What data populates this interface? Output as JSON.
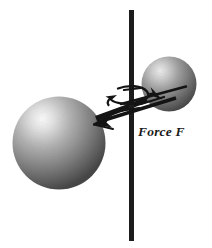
{
  "figure": {
    "background_color": "#ffffff",
    "width": 212,
    "height": 248,
    "labels": {
      "force": "Force F"
    },
    "axis": {
      "name": "rotation-axis",
      "orientation": "vertical",
      "color": "#1c1c1c",
      "x": 131.5,
      "y_top": 10,
      "y_bottom": 241,
      "thickness": 5
    },
    "spheres": [
      {
        "name": "large-sphere",
        "cx": 59,
        "cy": 143,
        "r": 46.5,
        "highlight_color": "#f2f2f2",
        "mid_color": "#8d8d8d",
        "edge_color": "#3f3f3f",
        "highlight_x_pct": 32,
        "highlight_y_pct": 24
      },
      {
        "name": "small-sphere",
        "cx": 169,
        "cy": 84,
        "r": 27.5,
        "highlight_color": "#e9e9e9",
        "mid_color": "#7e7e7e",
        "edge_color": "#3a3a3a",
        "highlight_x_pct": 34,
        "highlight_y_pct": 26
      }
    ],
    "rod": {
      "name": "connecting-rod",
      "color": "#141414",
      "x1": 96,
      "y1": 117,
      "x2": 160,
      "y2": 94,
      "thickness": 5
    },
    "force_arrow": {
      "name": "force-arrow",
      "color": "#141414",
      "direction": "down-left",
      "tail_x": 178,
      "tail_y": 90,
      "tip_x": 93,
      "tip_y": 122
    },
    "rotation_arrow": {
      "name": "rotation-arrow",
      "color": "#141414",
      "description": "curved arrow indicating spin about the vertical axis",
      "cx": 131,
      "cy": 98
    },
    "force_label_position": {
      "x": 138,
      "y": 136
    },
    "colors": {
      "ink": "#141414",
      "sphere_light": "#f2f2f2",
      "sphere_dark": "#3f3f3f",
      "page": "#ffffff"
    }
  }
}
